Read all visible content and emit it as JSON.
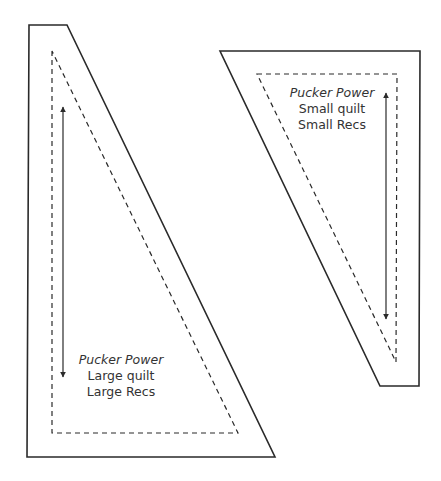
{
  "colors": {
    "stroke": "#2a2a2a",
    "text": "#333333",
    "background": "#ffffff"
  },
  "large_template": {
    "title": "Pucker Power",
    "line2": "Large quilt",
    "line3": "Large Recs"
  },
  "small_template": {
    "title": "Pucker Power",
    "line2": "Small quilt",
    "line3": "Small Recs"
  }
}
